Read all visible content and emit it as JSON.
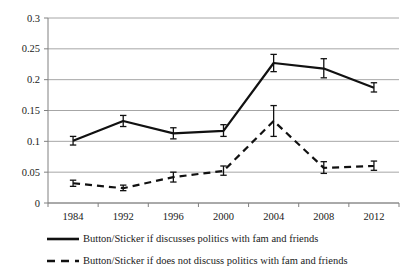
{
  "chart_data": {
    "type": "line",
    "title": "",
    "subtitle": "",
    "xlabel": "",
    "ylabel": "",
    "categories": [
      "1984",
      "1992",
      "1996",
      "2000",
      "2004",
      "2008",
      "2012"
    ],
    "ylim": [
      0,
      0.3
    ],
    "y_ticks": [
      0,
      0.05,
      0.1,
      0.15,
      0.2,
      0.25,
      0.3
    ],
    "y_tick_labels": [
      "0",
      "0.05",
      "0.1",
      "0.15",
      "0.2",
      "0.25",
      "0.3"
    ],
    "grid": "horizontal",
    "legend_position": "bottom",
    "series": [
      {
        "name": "Button/Sticker if discusses politics with fam and friends",
        "style": "solid",
        "color": "#111111",
        "values": [
          0.101,
          0.133,
          0.113,
          0.117,
          0.227,
          0.218,
          0.187
        ],
        "error_low": [
          0.094,
          0.124,
          0.104,
          0.108,
          0.213,
          0.203,
          0.18
        ],
        "error_high": [
          0.108,
          0.142,
          0.122,
          0.127,
          0.241,
          0.234,
          0.195
        ]
      },
      {
        "name": "Button/Sticker if does not discuss politics with fam and friends",
        "style": "dashed",
        "color": "#111111",
        "values": [
          0.032,
          0.024,
          0.042,
          0.052,
          0.133,
          0.057,
          0.06
        ],
        "error_low": [
          0.027,
          0.02,
          0.034,
          0.045,
          0.108,
          0.048,
          0.053
        ],
        "error_high": [
          0.037,
          0.029,
          0.05,
          0.06,
          0.158,
          0.067,
          0.068
        ]
      }
    ]
  },
  "legend": {
    "items": [
      {
        "label": "Button/Sticker if discusses politics with fam and friends",
        "style": "solid"
      },
      {
        "label": "Button/Sticker if does not discuss politics with fam and friends",
        "style": "dashed"
      }
    ]
  },
  "axis": {
    "grid_color": "#a6a6a6",
    "axis_color": "#808080",
    "line_color": "#111111"
  }
}
